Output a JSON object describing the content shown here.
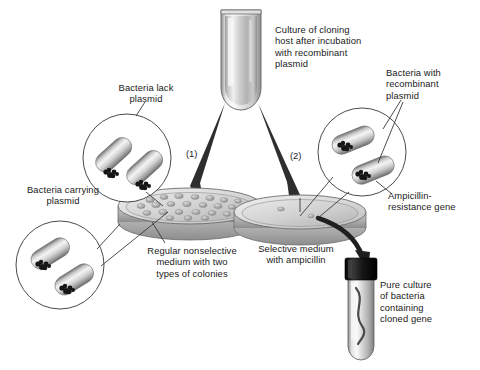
{
  "figure": {
    "background_color": "#ffffff",
    "text_color": "#1a1a1a",
    "width": 480,
    "height": 370
  },
  "labels": {
    "culture_tube": "Culture of cloning\nhost after incubation\nwith recombinant\nplasmid",
    "bacteria_lack_plasmid": "Bacteria lack\nplasmid",
    "bacteria_with_recombinant_plasmid": "Bacteria with\nrecombinant\nplasmid",
    "bacteria_carrying_plasmid": "Bacteria carrying\nplasmid",
    "ampicillin_resistance_gene": "Ampicillin-\nresistance gene",
    "nonselective_medium": "Regular nonselective\nmedium with two\ntypes of colonies",
    "selective_medium": "Selective medium\nwith ampicillin",
    "pure_culture": "Pure culture\nof bacteria\ncontaining\ncloned gene"
  },
  "steps": {
    "step_one": "(1)",
    "step_two": "(2)"
  },
  "elements": {
    "culture_tube_name": "culture-tube",
    "left_plate_name": "nonselective-agar-plate",
    "right_plate_name": "selective-agar-plate",
    "pure_culture_tube_name": "pure-culture-tube"
  },
  "colors": {
    "line": "#3a3a3a",
    "arrow_fill": "#2e2e2e",
    "glass_light": "#f2f2f2",
    "glass_mid": "#bcbcbc",
    "glass_dark": "#8a8a8a",
    "medium_light": "#e6e6e6",
    "medium_mid": "#c4c4c4",
    "medium_dark": "#9c9c9c",
    "colony": "#a8a8a8",
    "cell_light": "#ededed",
    "cell_mid": "#b5b5b5",
    "cell_dark": "#777777",
    "chromosome": "#1c1c1c",
    "cap_black": "#0d0d0d"
  }
}
